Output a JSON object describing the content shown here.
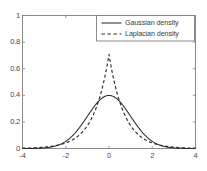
{
  "chart_data": {
    "type": "line",
    "title": "",
    "xlabel": "",
    "ylabel": "",
    "xlim": [
      -4,
      4
    ],
    "ylim": [
      0,
      1
    ],
    "xticks": [
      -4,
      -2,
      0,
      2,
      4
    ],
    "xtick_labels": [
      "-4",
      "-2",
      "0",
      "2",
      "4"
    ],
    "yticks": [
      0,
      0.2,
      0.4,
      0.6,
      0.8,
      1
    ],
    "ytick_labels": [
      "0",
      "0.2",
      "0.4",
      "0.6",
      "0.8",
      "1"
    ],
    "grid": false,
    "legend_position": "top-right",
    "box": true,
    "tick_direction": "in",
    "axes_color": "#808080",
    "series": [
      {
        "name": "Gaussian density",
        "style": "solid",
        "color": "#2b2b2b",
        "formula": "normal pdf, mu=0, sigma=1",
        "mu": 0,
        "sigma": 1,
        "peak": 0.3989,
        "x": [
          -4,
          -3.75,
          -3.5,
          -3.25,
          -3,
          -2.75,
          -2.5,
          -2.25,
          -2,
          -1.75,
          -1.5,
          -1.25,
          -1,
          -0.75,
          -0.5,
          -0.25,
          0,
          0.25,
          0.5,
          0.75,
          1,
          1.25,
          1.5,
          1.75,
          2,
          2.25,
          2.5,
          2.75,
          3,
          3.25,
          3.5,
          3.75,
          4
        ],
        "y": [
          0.0001,
          0.0004,
          0.0009,
          0.002,
          0.0044,
          0.0091,
          0.0175,
          0.0317,
          0.054,
          0.0863,
          0.1295,
          0.1826,
          0.242,
          0.3011,
          0.3521,
          0.3867,
          0.3989,
          0.3867,
          0.3521,
          0.3011,
          0.242,
          0.1826,
          0.1295,
          0.0863,
          0.054,
          0.0317,
          0.0175,
          0.0091,
          0.0044,
          0.002,
          0.0009,
          0.0004,
          0.0001
        ]
      },
      {
        "name": "Laplacian density",
        "style": "dashed",
        "color": "#2b2b2b",
        "formula": "laplace pdf, mu=0, b=0.7071",
        "mu": 0,
        "b": 0.7071,
        "peak": 0.7071,
        "x": [
          -4,
          -3.75,
          -3.5,
          -3.25,
          -3,
          -2.75,
          -2.5,
          -2.25,
          -2,
          -1.75,
          -1.5,
          -1.25,
          -1,
          -0.75,
          -0.5,
          -0.25,
          0,
          0.25,
          0.5,
          0.75,
          1,
          1.25,
          1.5,
          1.75,
          2,
          2.25,
          2.5,
          2.75,
          3,
          3.25,
          3.5,
          3.75,
          4
        ],
        "y": [
          0.0024,
          0.0035,
          0.005,
          0.0071,
          0.0101,
          0.0143,
          0.0204,
          0.029,
          0.0412,
          0.0586,
          0.0833,
          0.1185,
          0.1685,
          0.2396,
          0.3407,
          0.4845,
          0.7071,
          0.4845,
          0.3407,
          0.2396,
          0.1685,
          0.1185,
          0.0833,
          0.0586,
          0.0412,
          0.029,
          0.0204,
          0.0143,
          0.0101,
          0.0071,
          0.005,
          0.0035,
          0.0024
        ]
      }
    ],
    "legend": [
      {
        "label": "Gaussian density",
        "style": "solid"
      },
      {
        "label": "Laplacian density",
        "style": "dashed"
      }
    ]
  }
}
